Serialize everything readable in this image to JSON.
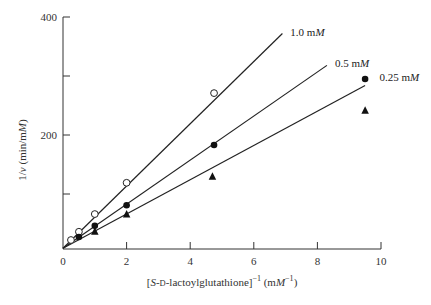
{
  "chart_data": {
    "type": "scatter",
    "title": "",
    "xlabel_parts": {
      "prefix": "[",
      "s": "S",
      "mid": "-",
      "d": "D",
      "rest": "-lactoylglutathione]",
      "sup1": "−1",
      "unit_open": " (m",
      "M": "M",
      "sup2": "−1",
      "unit_close": ")"
    },
    "xlabel": "[S-D-lactoylglutathione]⁻¹ (mM⁻¹)",
    "ylabel_parts": {
      "one": "1/",
      "v": "v",
      "unit": " (min/m",
      "M": "M",
      "close": ")"
    },
    "ylabel": "1/v (min/mM)",
    "xlim": [
      0,
      10
    ],
    "ylim": [
      0,
      400
    ],
    "xticks": [
      0,
      2,
      4,
      6,
      8,
      10
    ],
    "xtick_labels": [
      "0",
      "2",
      "4",
      "6",
      "8",
      "10"
    ],
    "yticks": [
      100,
      200,
      300,
      400
    ],
    "ytick_labels": [
      "",
      "200",
      "",
      "400"
    ],
    "grid": false,
    "legend": "inline labels at line ends",
    "series": [
      {
        "name": "1.0 mM",
        "label_num": "1.0 m",
        "label_unit": "M",
        "marker": "open-circle",
        "x": [
          0.25,
          0.5,
          1.0,
          2.0,
          4.75
        ],
        "y": [
          22,
          36,
          66,
          119,
          271
        ],
        "fit_line": {
          "x0": 0,
          "y0": 8,
          "x1": 6.9,
          "y1": 372
        },
        "label_pos": {
          "x": 7.15,
          "y": 374
        }
      },
      {
        "name": "0.5 mM",
        "label_num": "0.5 m",
        "label_unit": "M",
        "marker": "filled-circle",
        "x": [
          0.5,
          1.0,
          2.0,
          4.75
        ],
        "y": [
          27,
          46,
          81,
          183
        ],
        "fit_line": {
          "x0": 0,
          "y0": 8,
          "x1": 8.3,
          "y1": 318
        },
        "label_pos": {
          "x": 8.55,
          "y": 322
        }
      },
      {
        "name": "0.25 mM",
        "label_num": "0.25 m",
        "label_unit": "M",
        "marker": "filled-triangle",
        "x": [
          1.0,
          2.0,
          4.7,
          9.5
        ],
        "y": [
          37,
          66,
          130,
          242
        ],
        "fit_line": {
          "x0": 0,
          "y0": 8,
          "x1": 9.5,
          "y1": 284
        },
        "label_pos": {
          "x": 9.95,
          "y": 298
        }
      },
      {
        "name": "0.25 mM (upper point)",
        "marker": "filled-circle",
        "x": [
          9.5
        ],
        "y": [
          295
        ]
      }
    ]
  }
}
